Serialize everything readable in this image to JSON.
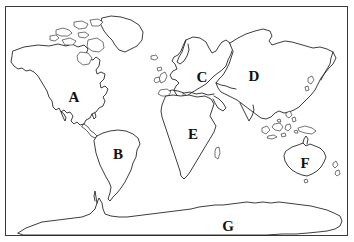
{
  "figure": {
    "background_color": "#ffffff",
    "outline_color": "#1a1a1a",
    "frame_color": "#3a3a3a",
    "label_color": "#111111"
  },
  "labels": [
    {
      "letter": "A",
      "region": "north-america",
      "x": 74,
      "y": 97
    },
    {
      "letter": "B",
      "region": "south-america",
      "x": 118,
      "y": 154
    },
    {
      "letter": "C",
      "region": "europe",
      "x": 202,
      "y": 77
    },
    {
      "letter": "D",
      "region": "asia",
      "x": 254,
      "y": 76
    },
    {
      "letter": "E",
      "region": "africa",
      "x": 193,
      "y": 134
    },
    {
      "letter": "F",
      "region": "australia",
      "x": 305,
      "y": 163
    },
    {
      "letter": "G",
      "region": "antarctica",
      "x": 228,
      "y": 226
    }
  ],
  "legend": {
    "a_label": "A",
    "b_label": "B",
    "c_label": "C",
    "d_label": "D",
    "e_label": "E",
    "f_label": "F",
    "g_label": "G"
  }
}
